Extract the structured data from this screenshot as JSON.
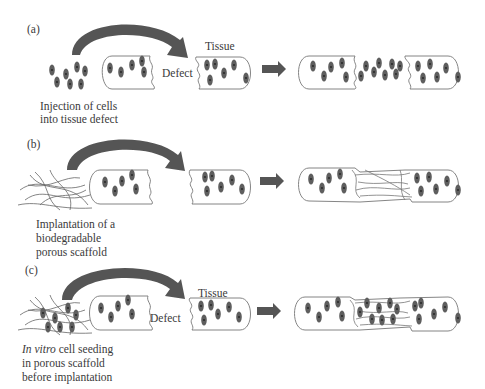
{
  "panels": [
    {
      "id": "a",
      "label": "(a)",
      "caption_lines": [
        "Injection of cells",
        "into tissue defect"
      ],
      "defect_label": "Defect",
      "tissue_label": "Tissue"
    },
    {
      "id": "b",
      "label": "(b)",
      "caption_lines": [
        "Implantation of a",
        "biodegradable",
        "porous scaffold"
      ]
    },
    {
      "id": "c",
      "label": "(c)",
      "caption_italic": "In vitro",
      "caption_lines": [
        " cell seeding",
        "in porous scaffold",
        "before implantation"
      ],
      "defect_label": "Defect",
      "tissue_label": "Tissue"
    }
  ],
  "colors": {
    "arrow": "#555555",
    "nucleus": "#5a5a5a",
    "outline": "#777777",
    "fiber": "#666666"
  }
}
